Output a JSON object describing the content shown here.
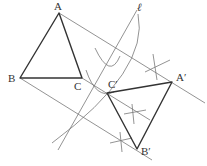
{
  "diagram": {
    "colors": {
      "triangle": "#333333",
      "construction": "#777777",
      "background": "#ffffff"
    },
    "points": {
      "A": {
        "label": "A",
        "x": 59,
        "y": 13
      },
      "B": {
        "label": "B",
        "x": 20,
        "y": 78
      },
      "C": {
        "label": "C",
        "x": 82,
        "y": 78
      },
      "A_prime": {
        "label": "A′",
        "x": 172,
        "y": 82
      },
      "B_prime": {
        "label": "B′",
        "x": 137,
        "y": 149
      },
      "C_prime": {
        "label": "C′",
        "x": 107,
        "y": 93
      }
    },
    "line": {
      "label": "ℓ"
    },
    "triangles": [
      "ABC",
      "A′B′C′"
    ]
  }
}
